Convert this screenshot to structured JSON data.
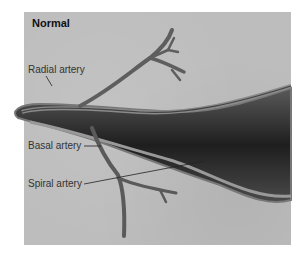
{
  "figure": {
    "title": "Normal",
    "labels": [
      {
        "id": "radial",
        "text": "Radial artery"
      },
      {
        "id": "basal",
        "text": "Basal artery"
      },
      {
        "id": "spiral",
        "text": "Spiral artery"
      }
    ]
  },
  "colors": {
    "background": "#bdbdbd",
    "vessel_dark": "#2a2a2a",
    "vessel_wall": "#6d6d6d",
    "text": "#333333"
  }
}
